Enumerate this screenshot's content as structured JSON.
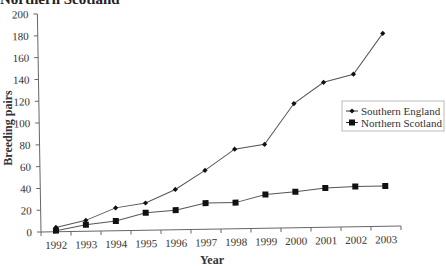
{
  "chart_data": {
    "type": "line",
    "title": "Northern Scotland",
    "xlabel": "Year",
    "ylabel": "Breeding pairs",
    "x": [
      "1992",
      "1993",
      "1994",
      "1995",
      "1996",
      "1997",
      "1998",
      "1999",
      "2000",
      "2001",
      "2002",
      "2003"
    ],
    "ylim": [
      0,
      200
    ],
    "yticks": [
      0,
      20,
      40,
      60,
      80,
      100,
      120,
      140,
      160,
      180,
      200
    ],
    "grid": false,
    "legend_position": "right",
    "series": [
      {
        "name": "Southern England",
        "marker": "small-diamond",
        "values": [
          4,
          10,
          21,
          25,
          37,
          54,
          73,
          77,
          114,
          133,
          140,
          177
        ]
      },
      {
        "name": "Northern Scotland",
        "marker": "square",
        "values": [
          1,
          6,
          9,
          16,
          18,
          24,
          24,
          31,
          33,
          36,
          37,
          37
        ]
      }
    ]
  }
}
